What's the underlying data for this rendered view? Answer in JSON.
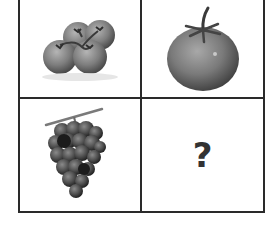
{
  "puzzle": {
    "type": "2x2 analogy grid",
    "cells": [
      {
        "position": "top-left",
        "content": "cherry-tomatoes-on-vine",
        "label": ""
      },
      {
        "position": "top-right",
        "content": "tomato",
        "label": ""
      },
      {
        "position": "bottom-left",
        "content": "grape-bunch",
        "label": ""
      },
      {
        "position": "bottom-right",
        "content": "unknown",
        "label": "?"
      }
    ],
    "colors": {
      "grid_line": "#2a2a2a",
      "background": "#ffffff",
      "question_mark": "#333333"
    }
  }
}
